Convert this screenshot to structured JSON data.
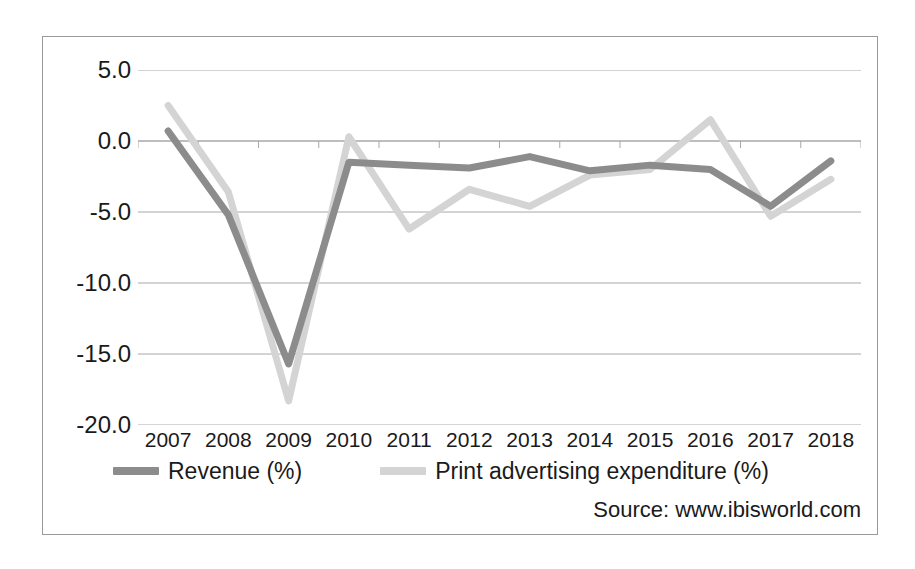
{
  "chart_data": {
    "type": "line",
    "title": "",
    "subtitle": "",
    "xlabel": "",
    "ylabel": "",
    "categories": [
      "2007",
      "2008",
      "2009",
      "2010",
      "2011",
      "2012",
      "2013",
      "2014",
      "2015",
      "2016",
      "2017",
      "2018"
    ],
    "ylim": [
      -20.0,
      5.0
    ],
    "ytick_labels": [
      "5.0",
      "0.0",
      "-5.0",
      "-10.0",
      "-15.0",
      "-20.0"
    ],
    "ytick_values": [
      5.0,
      0.0,
      -5.0,
      -10.0,
      -15.0,
      -20.0
    ],
    "grid": "horizontal",
    "legend_position": "bottom",
    "series": [
      {
        "name": "Revenue (%)",
        "color": "#8c8c8c",
        "values": [
          0.7,
          -5.2,
          -15.7,
          -1.5,
          -1.7,
          -1.9,
          -1.1,
          -2.1,
          -1.7,
          -2.0,
          -4.6,
          -1.4
        ]
      },
      {
        "name": "Print advertising expenditure (%)",
        "color": "#d4d4d4",
        "values": [
          2.5,
          -3.6,
          -18.3,
          0.3,
          -6.2,
          -3.4,
          -4.6,
          -2.4,
          -2.0,
          1.5,
          -5.3,
          -2.7
        ]
      }
    ],
    "annotations": [
      {
        "name": "source",
        "text": "Source: www.ibisworld.com"
      }
    ]
  },
  "legend": {
    "entries": [
      {
        "label": "Revenue (%)",
        "color": "#8c8c8c"
      },
      {
        "label": "Print advertising expenditure (%)",
        "color": "#d4d4d4"
      }
    ]
  },
  "source": {
    "text": "Source: www.ibisworld.com"
  },
  "colors": {
    "revenue_line": "#8c8c8c",
    "print_line": "#d4d4d4",
    "gridline": "#a8a8a8",
    "frame_border": "#9a9a9a",
    "text": "#1a1a1a",
    "background": "#ffffff"
  }
}
